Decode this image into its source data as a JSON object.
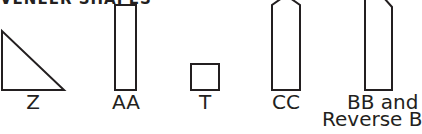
{
  "heading": "VENEER SHAPES",
  "shapes": [
    {
      "id": "Z",
      "label": "Z",
      "shape": "right-triangle"
    },
    {
      "id": "AA",
      "label": "AA",
      "shape": "tall-rectangle"
    },
    {
      "id": "T",
      "label": "T",
      "shape": "square"
    },
    {
      "id": "CC",
      "label": "CC",
      "shape": "pointed-top-rectangle"
    },
    {
      "id": "BB",
      "label_line1": "BB and",
      "label_line2": "Reverse B",
      "shape": "beveled-corner-rectangle"
    }
  ],
  "colors": {
    "stroke": "#231f20",
    "background": "#ffffff"
  }
}
